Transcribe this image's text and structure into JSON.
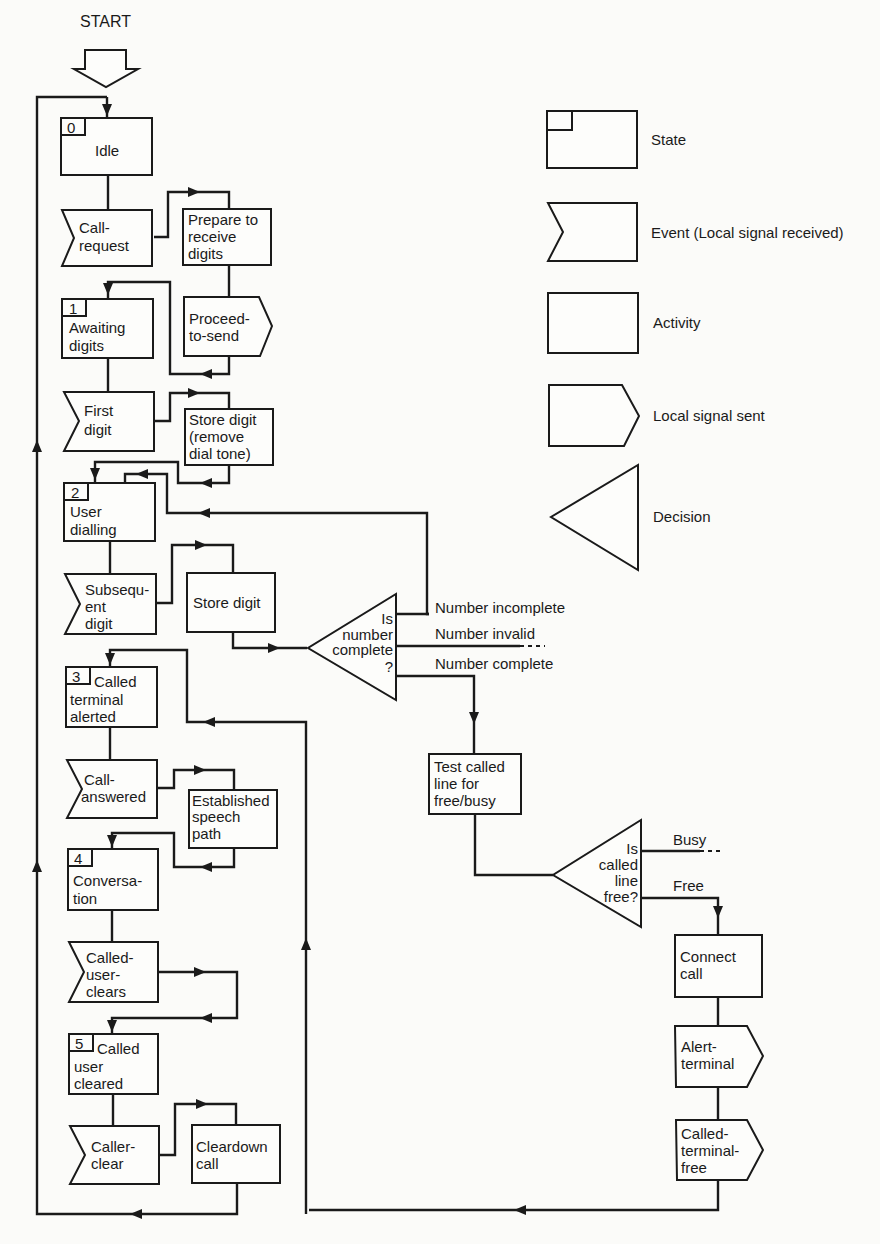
{
  "start_label": "START",
  "states": [
    {
      "num": "0",
      "lines": [
        "Idle"
      ]
    },
    {
      "num": "1",
      "lines": [
        "Awaiting",
        "digits"
      ]
    },
    {
      "num": "2",
      "lines": [
        "User",
        "dialling"
      ]
    },
    {
      "num": "3",
      "lines": [
        "Called",
        "terminal",
        "alerted"
      ]
    },
    {
      "num": "4",
      "lines": [
        "Conversa-",
        "tion"
      ]
    },
    {
      "num": "5",
      "lines": [
        "Called",
        "user",
        "cleared"
      ]
    }
  ],
  "events": [
    {
      "lines": [
        "Call-",
        "request"
      ]
    },
    {
      "lines": [
        "First",
        "digit"
      ]
    },
    {
      "lines": [
        "Subsequ-",
        "ent",
        "digit"
      ]
    },
    {
      "lines": [
        "Call-",
        "answered"
      ]
    },
    {
      "lines": [
        "Called-",
        "user-",
        "clears"
      ]
    },
    {
      "lines": [
        "Caller-",
        "clear"
      ]
    }
  ],
  "activities": [
    {
      "lines": [
        "Prepare to",
        "receive",
        "digits"
      ]
    },
    {
      "lines": [
        "Store digit",
        "(remove",
        "dial tone)"
      ]
    },
    {
      "lines": [
        "Store digit"
      ]
    },
    {
      "lines": [
        "Established",
        "speech",
        "path"
      ]
    },
    {
      "lines": [
        "Cleardown",
        "call"
      ]
    },
    {
      "lines": [
        "Test called",
        "line for",
        "free/busy"
      ]
    },
    {
      "lines": [
        "Connect",
        "call"
      ]
    }
  ],
  "signals_sent": [
    {
      "lines": [
        "Proceed-",
        "to-send"
      ]
    },
    {
      "lines": [
        "Alert-",
        "terminal"
      ]
    },
    {
      "lines": [
        "Called-",
        "terminal-",
        "free"
      ]
    }
  ],
  "decisions": [
    {
      "lines": [
        "Is",
        "number",
        "complete",
        "?"
      ],
      "outcomes": [
        "Number incomplete",
        "Number invalid",
        "Number complete"
      ]
    },
    {
      "lines": [
        "Is",
        "called",
        "line",
        "free?"
      ],
      "outcomes": [
        "Busy",
        "Free"
      ]
    }
  ],
  "legend": [
    {
      "shape": "state",
      "label": "State"
    },
    {
      "shape": "event",
      "label": "Event (Local signal received)"
    },
    {
      "shape": "activity",
      "label": "Activity"
    },
    {
      "shape": "signal-sent",
      "label": "Local signal sent"
    },
    {
      "shape": "decision",
      "label": "Decision"
    }
  ]
}
